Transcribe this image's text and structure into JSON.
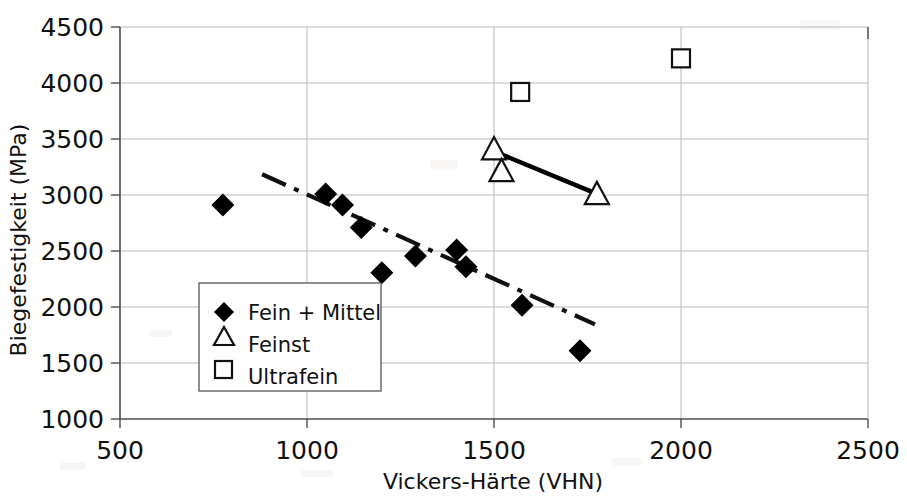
{
  "chart_data": {
    "type": "scatter",
    "title": "",
    "xlabel": "Vickers-Härte (VHN)",
    "ylabel": "Biegefestigkeit (MPa)",
    "xlim": [
      500,
      2500
    ],
    "ylim": [
      1000,
      4500
    ],
    "xticks": [
      500,
      1000,
      1500,
      2000,
      2500
    ],
    "yticks": [
      1000,
      1500,
      2000,
      2500,
      3000,
      3500,
      4000,
      4500
    ],
    "xtick_labels": [
      "500",
      "1000",
      "1500",
      "2000",
      "2500"
    ],
    "ytick_labels": [
      "1000",
      "1500",
      "2000",
      "2500",
      "3000",
      "3500",
      "4000",
      "4500"
    ],
    "grid": "horizontal-and-vertical",
    "legend_position": "lower-left-inside",
    "series": [
      {
        "name": "Fein + Mittel",
        "marker": "filled-diamond",
        "points": [
          {
            "x": 775,
            "y": 2910
          },
          {
            "x": 1050,
            "y": 3010
          },
          {
            "x": 1095,
            "y": 2910
          },
          {
            "x": 1145,
            "y": 2710
          },
          {
            "x": 1200,
            "y": 2305
          },
          {
            "x": 1290,
            "y": 2455
          },
          {
            "x": 1400,
            "y": 2510
          },
          {
            "x": 1425,
            "y": 2360
          },
          {
            "x": 1575,
            "y": 2015
          },
          {
            "x": 1730,
            "y": 1610
          }
        ]
      },
      {
        "name": "Feinst",
        "marker": "open-triangle",
        "points": [
          {
            "x": 1500,
            "y": 3410
          },
          {
            "x": 1520,
            "y": 3215
          },
          {
            "x": 1775,
            "y": 3010
          }
        ]
      },
      {
        "name": "Ultrafein",
        "marker": "open-square",
        "points": [
          {
            "x": 1570,
            "y": 3920
          },
          {
            "x": 2000,
            "y": 4220
          }
        ]
      }
    ],
    "trendlines": [
      {
        "name": "Fein + Mittel trend",
        "style": "dash-dot",
        "x0": 880,
        "y0": 3185,
        "x1": 1770,
        "y1": 1845
      },
      {
        "name": "Feinst trend",
        "style": "solid",
        "x0": 1500,
        "y0": 3390,
        "x1": 1775,
        "y1": 3010
      }
    ]
  },
  "axes": {
    "x_title": "Vickers-Härte (VHN)",
    "y_title": "Biegefestigkeit (MPa)"
  },
  "legend": {
    "items": [
      {
        "label": "Fein + Mittel",
        "marker": "filled-diamond"
      },
      {
        "label": "Feinst",
        "marker": "open-triangle"
      },
      {
        "label": "Ultrafein",
        "marker": "open-square"
      }
    ]
  },
  "ticks": {
    "x": [
      "500",
      "1000",
      "1500",
      "2000",
      "2500"
    ],
    "y": [
      "4500",
      "4000",
      "3500",
      "3000",
      "2500",
      "2000",
      "1500",
      "1000"
    ]
  }
}
